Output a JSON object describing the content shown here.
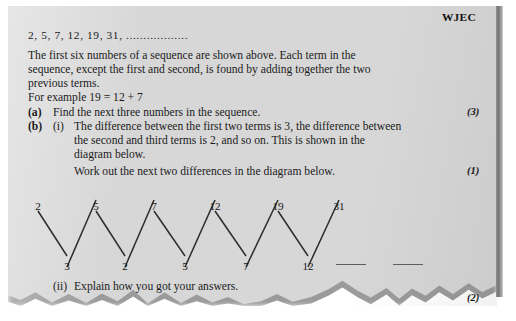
{
  "exam": {
    "board_logo": "WJEC",
    "sequence_line": "2,  5,  7,  12,  19,  31,  ..................",
    "intro_line1": "The first six numbers of a sequence are shown above. Each term in the",
    "intro_line2": "sequence, except the first and second, is found by adding together the two",
    "intro_line3": "previous terms.",
    "intro_line4": "For example 19 = 12 + 7"
  },
  "questions": [
    {
      "label": "(a)",
      "text": "Find the next three numbers in the sequence.",
      "marks": "(3)"
    },
    {
      "label": "(b)",
      "sub_label": "(i)",
      "line1": "The difference between the first two terms is 3, the difference between",
      "line2": "the second and third terms is 2, and so on. This is shown in the",
      "line3": "diagram below.",
      "line4": "Work out the next two differences in the diagram below.",
      "marks": "(1)"
    },
    {
      "sub_label": "(ii)",
      "text": "Explain how you got your answers.",
      "marks": "(2)"
    }
  ],
  "chart_data": {
    "type": "line",
    "xlabel": "",
    "ylabel": "",
    "top_values": [
      "2",
      "5",
      "7",
      "12",
      "19",
      "31"
    ],
    "bottom_values": [
      "3",
      "2",
      "5",
      "7",
      "12"
    ],
    "blank_answers": [
      "",
      ""
    ],
    "top_x": [
      30,
      88,
      146,
      207,
      270,
      331
    ],
    "bottom_x": [
      59,
      117,
      177,
      238,
      300
    ],
    "answer_line_x": [
      328,
      385
    ],
    "answer_line_width": 30,
    "top_y": 22,
    "bottom_y": 78,
    "stroke_color": "#2b2b2b"
  },
  "colors": {
    "paper": "#d7d7d7",
    "ink": "#1b1b1b",
    "rule": "#5d5d5d"
  }
}
